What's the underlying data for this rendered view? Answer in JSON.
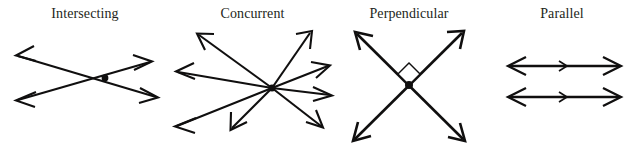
{
  "figure": {
    "width": 641,
    "height": 152,
    "background_color": "#ffffff",
    "ink_color": "#100f0f",
    "label_color": "#231f20"
  },
  "panels": [
    {
      "id": "intersecting",
      "label": "Intersecting",
      "description": "Two straight lines crossing at a single marked point, each line with arrowheads at both ends",
      "line_count": 2,
      "intersection_points": 1,
      "has_center_dot": true,
      "right_angle_marker": false
    },
    {
      "id": "concurrent",
      "label": "Concurrent",
      "description": "Several lines all passing through one common point, arrowheads on every end",
      "line_count": 4,
      "ray_count": 8,
      "intersection_points": 1,
      "has_center_dot": true,
      "right_angle_marker": false
    },
    {
      "id": "perpendicular",
      "label": "Perpendicular",
      "description": "Two lines crossing at a right angle, marked with a small square at the vertex",
      "line_count": 2,
      "intersection_points": 1,
      "has_center_dot": true,
      "right_angle_marker": true,
      "angle_degrees": 90
    },
    {
      "id": "parallel",
      "label": "Parallel",
      "description": "Two horizontal lines that never meet, each with arrowheads at both ends and a direction tick at the middle",
      "line_count": 2,
      "intersection_points": 0,
      "has_center_dot": false,
      "right_angle_marker": false
    }
  ]
}
